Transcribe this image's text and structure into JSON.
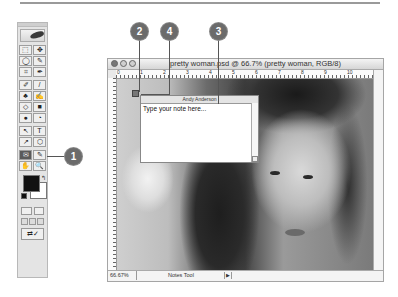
{
  "document_window": {
    "title": "pretty woman.psd @ 66.7% (pretty woman, RGB/8)",
    "ruler_labels": [
      "0",
      "1",
      "2",
      "3",
      "4",
      "5",
      "6",
      "7",
      "8",
      "9",
      "10"
    ],
    "status": {
      "zoom": "66.67%",
      "tool": "Notes Tool",
      "menu_arrow": "▶"
    }
  },
  "note": {
    "author": "Andy Anderson",
    "placeholder_text": "Type your note here..."
  },
  "toolbox": {
    "tools": [
      "⬚",
      "✥",
      "◯",
      "✎",
      "⌗",
      "✒",
      "✐",
      "/",
      "♣",
      "✍",
      "◇",
      "■",
      "●",
      "◔",
      "↖",
      "T",
      "↗",
      "⬡",
      "✉",
      "✎",
      "✋",
      "🔍"
    ],
    "active_tool_index": 18,
    "swap_icon": "↰",
    "jump_label": "⇄✓",
    "foreground_color": "#111111",
    "background_color": "#ffffff"
  },
  "callouts": [
    {
      "label": "1"
    },
    {
      "label": "2"
    },
    {
      "label": "4"
    },
    {
      "label": "3"
    }
  ]
}
